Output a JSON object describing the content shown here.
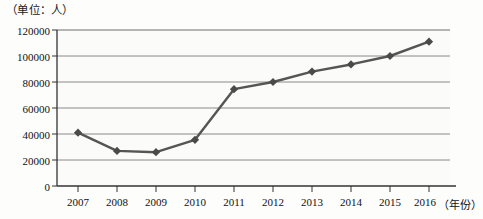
{
  "unit_label": "（单位：人）",
  "x_axis_title": "（年份）",
  "chart_data": {
    "type": "line",
    "title": "",
    "subtitle": "",
    "xlabel": "（年份）",
    "ylabel": "（单位：人）",
    "categories": [
      "2007",
      "2008",
      "2009",
      "2010",
      "2011",
      "2012",
      "2013",
      "2014",
      "2015",
      "2016"
    ],
    "values": [
      41000,
      27000,
      26000,
      35500,
      74500,
      80000,
      88000,
      93500,
      100000,
      111000
    ],
    "series": [
      {
        "name": "人数",
        "values": [
          41000,
          27000,
          26000,
          35500,
          74500,
          80000,
          88000,
          93500,
          100000,
          111000
        ]
      }
    ],
    "ylim": [
      0,
      120000
    ],
    "yticks": [
      0,
      20000,
      40000,
      60000,
      80000,
      100000,
      120000
    ],
    "ytick_labels": [
      "0",
      "20000",
      "40000",
      "60000",
      "80000",
      "100000",
      "120000"
    ],
    "xtick_labels": [
      "2007",
      "2008",
      "2009",
      "2010",
      "2011",
      "2012",
      "2013",
      "2014",
      "2015",
      "2016"
    ],
    "grid": true,
    "grid_axis": "y",
    "legend": false,
    "legend_position": "none",
    "marker": "diamond",
    "line_color": "#555555",
    "marker_color": "#4a4a4a",
    "grid_color": "#888888",
    "axis_color": "#333333",
    "plot_background": "#fbfbfa"
  }
}
